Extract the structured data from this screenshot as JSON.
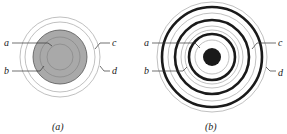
{
  "panels": [
    {
      "caption": "(a)",
      "labels": {
        "a": "a",
        "b": "b",
        "c": "c",
        "d": "d"
      },
      "description": "Filled gray disk with inner concentric rings, surrounded by two thin outer rings"
    },
    {
      "caption": "(b)",
      "labels": {
        "a": "a",
        "b": "b",
        "c": "c",
        "d": "d"
      },
      "description": "Solid black center dot with alternating thick black and thin gray concentric rings"
    }
  ],
  "colors": {
    "fill_gray": "#a9a9a9",
    "thin_ring": "#9a9a9a",
    "thick_ring": "#1a1a1a",
    "leader": "#333333"
  }
}
